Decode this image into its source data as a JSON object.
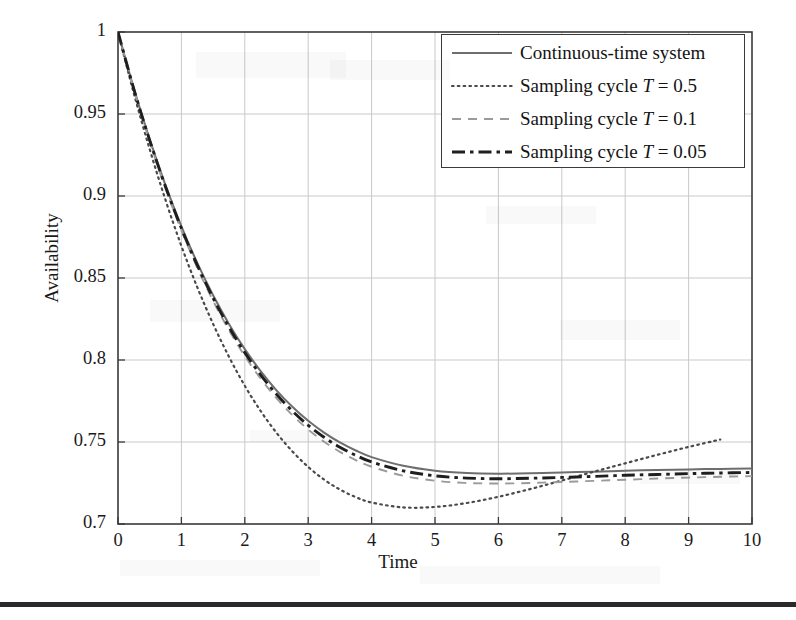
{
  "chart_data": {
    "type": "line",
    "title": "",
    "xlabel": "Time",
    "ylabel": "Availability",
    "xlim": [
      0,
      10
    ],
    "ylim": [
      0.7,
      1
    ],
    "xticks": [
      "0",
      "1",
      "2",
      "3",
      "4",
      "5",
      "6",
      "7",
      "8",
      "9",
      "10"
    ],
    "yticks": [
      "0.7",
      "0.75",
      "0.8",
      "0.85",
      "0.9",
      "0.95",
      "1"
    ],
    "grid": true,
    "legend_position": "top-right",
    "series": [
      {
        "name": "Continuous-time system",
        "style": "solid",
        "color": "#6e6e6e",
        "x": [
          0,
          0.25,
          0.5,
          0.75,
          1,
          1.25,
          1.5,
          1.75,
          2,
          2.25,
          2.5,
          2.75,
          3,
          3.25,
          3.5,
          3.75,
          4,
          4.5,
          5,
          5.5,
          6,
          6.5,
          7,
          7.5,
          8,
          8.5,
          9,
          9.5,
          10
        ],
        "values": [
          1,
          0.9655,
          0.9345,
          0.9065,
          0.8815,
          0.8592,
          0.8395,
          0.822,
          0.8066,
          0.7932,
          0.7815,
          0.7715,
          0.7629,
          0.7557,
          0.7497,
          0.7448,
          0.7408,
          0.7355,
          0.7325,
          0.7311,
          0.7307,
          0.7309,
          0.7314,
          0.7319,
          0.7325,
          0.7329,
          0.7333,
          0.7336,
          0.7338
        ]
      },
      {
        "name": "Sampling cycle T = 0.5",
        "style": "dotted",
        "color": "#4a4a4a",
        "x": [
          0,
          0.25,
          0.5,
          0.75,
          1,
          1.25,
          1.5,
          1.75,
          2,
          2.25,
          2.5,
          2.75,
          3,
          3.25,
          3.5,
          3.75,
          4,
          4.5,
          5,
          5.5,
          6,
          6.5,
          7,
          7.5,
          8,
          8.5,
          9,
          9.5
        ],
        "values": [
          1,
          0.9625,
          0.9285,
          0.8975,
          0.8695,
          0.8444,
          0.822,
          0.802,
          0.7843,
          0.7689,
          0.7556,
          0.7443,
          0.7348,
          0.7271,
          0.721,
          0.7164,
          0.7131,
          0.7101,
          0.7104,
          0.7128,
          0.7166,
          0.7213,
          0.7265,
          0.7318,
          0.737,
          0.7421,
          0.747,
          0.7515
        ]
      },
      {
        "name": "Sampling cycle T = 0.1",
        "style": "dashed",
        "color": "#9a9a9a",
        "x": [
          0,
          0.25,
          0.5,
          0.75,
          1,
          1.25,
          1.5,
          1.75,
          2,
          2.25,
          2.5,
          2.75,
          3,
          3.25,
          3.5,
          3.75,
          4,
          4.5,
          5,
          5.5,
          6,
          6.5,
          7,
          7.5,
          8,
          8.5,
          9,
          9.5,
          10
        ],
        "values": [
          1,
          0.9648,
          0.9332,
          0.9046,
          0.8791,
          0.8563,
          0.8361,
          0.8182,
          0.8024,
          0.7887,
          0.7767,
          0.7664,
          0.7576,
          0.7502,
          0.744,
          0.739,
          0.7349,
          0.7294,
          0.7264,
          0.725,
          0.7247,
          0.725,
          0.7256,
          0.7263,
          0.727,
          0.7277,
          0.7283,
          0.7288,
          0.7292
        ]
      },
      {
        "name": "Sampling cycle T = 0.05",
        "style": "dashdot",
        "color": "#1f1f1f",
        "x": [
          0,
          0.25,
          0.5,
          0.75,
          1,
          1.25,
          1.5,
          1.75,
          2,
          2.25,
          2.5,
          2.75,
          3,
          3.25,
          3.5,
          3.75,
          4,
          4.5,
          5,
          5.5,
          6,
          6.5,
          7,
          7.5,
          8,
          8.5,
          9,
          9.5,
          10
        ],
        "values": [
          1,
          0.9652,
          0.9339,
          0.9056,
          0.8803,
          0.8578,
          0.8378,
          0.8201,
          0.8045,
          0.791,
          0.7791,
          0.7689,
          0.7602,
          0.7529,
          0.7468,
          0.7419,
          0.7378,
          0.7324,
          0.7294,
          0.728,
          0.7276,
          0.7279,
          0.7284,
          0.729,
          0.7297,
          0.7302,
          0.7307,
          0.7311,
          0.7314
        ]
      }
    ]
  },
  "legend": {
    "items": [
      {
        "label_prefix": "Continuous-time system",
        "label_var": "",
        "label_suffix": ""
      },
      {
        "label_prefix": "Sampling cycle ",
        "label_var": "T",
        "label_suffix": " = 0.5"
      },
      {
        "label_prefix": "Sampling cycle ",
        "label_var": "T",
        "label_suffix": " = 0.1"
      },
      {
        "label_prefix": "Sampling cycle ",
        "label_var": "T",
        "label_suffix": " = 0.05"
      }
    ]
  },
  "colors": {
    "frame": "#3a3a3a",
    "grid": "#c9c9c9",
    "background": "#ffffff",
    "bottom_rule": "#2a2a2a"
  }
}
